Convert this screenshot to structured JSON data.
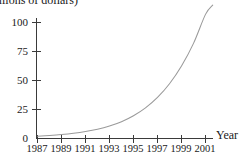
{
  "chart_data": {
    "type": "line",
    "title": "",
    "caption": "(millions of dollars)",
    "caption_clipped": true,
    "xlabel": "Year",
    "ylabel": "",
    "grid": false,
    "legend": "none",
    "xlim": [
      1987,
      2002.2
    ],
    "ylim": [
      0,
      116
    ],
    "x_tick_labels": [
      "1987",
      "1989",
      "1991",
      "1993",
      "1995",
      "1997",
      "1999",
      "2001"
    ],
    "x_ticks": [
      1987,
      1989,
      1991,
      1993,
      1995,
      1997,
      1999,
      2001
    ],
    "y_tick_labels": [
      "25",
      "50",
      "75",
      "100"
    ],
    "y_ticks": [
      25,
      50,
      75,
      100
    ],
    "origin_label": "0",
    "series": [
      {
        "name": "revenue",
        "color": "#9a9a9a",
        "x": [
          1987,
          1988,
          1989,
          1990,
          1991,
          1992,
          1993,
          1994,
          1995,
          1996,
          1997,
          1998,
          1999,
          2000,
          2001,
          2001.6
        ],
        "values": [
          2.0,
          2.6,
          3.4,
          4.5,
          6.0,
          8.0,
          10.8,
          14.5,
          19.6,
          26.4,
          35.4,
          47.2,
          62.5,
          82.0,
          107.0,
          115.0
        ]
      }
    ]
  }
}
